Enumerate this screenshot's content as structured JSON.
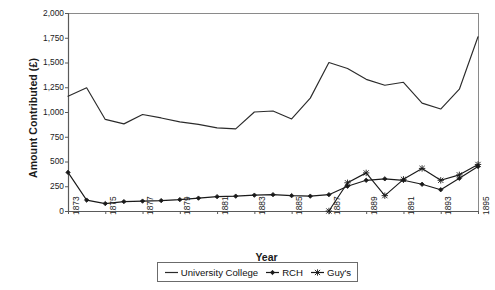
{
  "chart_data": {
    "type": "line",
    "title": "",
    "xlabel": "Year",
    "ylabel": "Amount Contributed (£)",
    "x": [
      1873,
      1874,
      1875,
      1876,
      1877,
      1878,
      1879,
      1880,
      1881,
      1882,
      1883,
      1884,
      1885,
      1886,
      1887,
      1888,
      1889,
      1890,
      1891,
      1892,
      1893,
      1894,
      1895
    ],
    "xtick_labels": [
      "1873",
      "1875",
      "1877",
      "1879",
      "1881",
      "1883",
      "1885",
      "1887",
      "1889",
      "1891",
      "1893",
      "1895"
    ],
    "xtick_values": [
      1873,
      1875,
      1877,
      1879,
      1881,
      1883,
      1885,
      1887,
      1889,
      1891,
      1893,
      1895
    ],
    "ytick_labels": [
      "0",
      "250",
      "500",
      "750",
      "1,000",
      "1,250",
      "1,500",
      "1,750",
      "2,000"
    ],
    "ytick_values": [
      0,
      250,
      500,
      750,
      1000,
      1250,
      1500,
      1750,
      2000
    ],
    "ylim": [
      0,
      2000
    ],
    "xlim": [
      1873,
      1895
    ],
    "grid": false,
    "legend_position": "bottom",
    "series": [
      {
        "name": "University College",
        "marker": "none",
        "color": "#2b2b2b",
        "values": [
          1160,
          1245,
          925,
          880,
          975,
          940,
          900,
          875,
          840,
          830,
          1000,
          1010,
          930,
          1140,
          1500,
          1440,
          1330,
          1270,
          1300,
          1090,
          1030,
          1230,
          1760
        ]
      },
      {
        "name": "RCH",
        "marker": "diamond",
        "color": "#1a1a1a",
        "values": [
          390,
          110,
          75,
          95,
          100,
          105,
          115,
          130,
          145,
          150,
          160,
          165,
          155,
          150,
          165,
          250,
          310,
          325,
          310,
          270,
          215,
          330,
          450
        ]
      },
      {
        "name": "Guy's",
        "marker": "cross",
        "color": "#1a1a1a",
        "values": [
          null,
          null,
          null,
          null,
          null,
          null,
          null,
          null,
          null,
          null,
          null,
          null,
          null,
          null,
          0,
          285,
          385,
          155,
          320,
          430,
          310,
          365,
          470
        ]
      }
    ]
  },
  "legend": {
    "items": [
      {
        "label": "University College",
        "key": "line-plain"
      },
      {
        "label": "RCH",
        "key": "line-diamond"
      },
      {
        "label": "Guy's",
        "key": "line-cross"
      }
    ]
  },
  "axes": {
    "y_title": "Amount Contributed (£)",
    "x_title": "Year"
  }
}
